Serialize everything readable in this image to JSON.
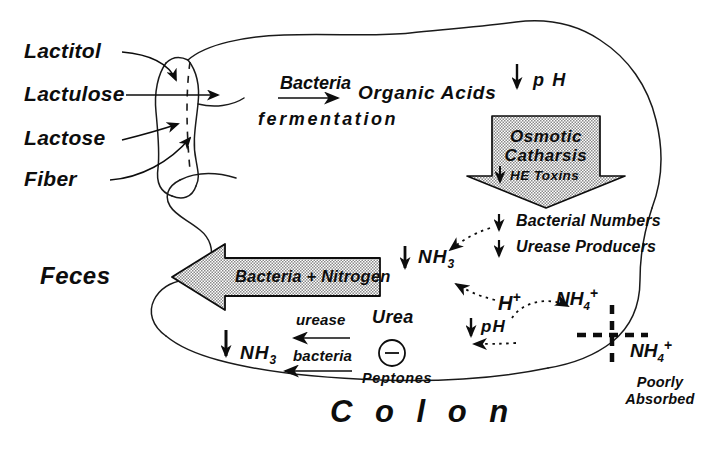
{
  "diagram": {
    "organ_label": "C o l o n"
  },
  "substrates": {
    "items": [
      {
        "label": "Lactitol"
      },
      {
        "label": "Lactulose"
      },
      {
        "label": "Lactose"
      },
      {
        "label": "Fiber"
      }
    ]
  },
  "fermentation": {
    "agent": "Bacteria",
    "process": "fermentation",
    "product": "Organic  Acids"
  },
  "ph_top": {
    "arrow": "↓",
    "label": "p H"
  },
  "osmotic": {
    "line1": "Osmotic",
    "line2": "Catharsis",
    "toxins_arrow": "↓",
    "toxins_label": "HE Toxins"
  },
  "bacterial": {
    "rows": [
      {
        "arrow": "↓",
        "label": "Bacterial Numbers"
      },
      {
        "arrow": "↓",
        "label": "Urease Producers"
      }
    ]
  },
  "feces": {
    "label": "Feces",
    "arrow_text": "Bacteria  +  Nitrogen"
  },
  "ammonia": {
    "upper": {
      "arrow": "↓",
      "label": "NH",
      "sub": "3"
    },
    "lower": {
      "arrow": "↓",
      "label": "NH",
      "sub": "3"
    }
  },
  "urea_cycle": {
    "enzyme": "urease",
    "organism": "bacteria",
    "substrate": "Urea",
    "peptones": "Peptones",
    "inhibition_symbol": "−"
  },
  "ions": {
    "proton": {
      "label": "H",
      "sup": "+"
    },
    "ammonium_inner": {
      "label": "NH",
      "sub": "4",
      "sup": "+"
    },
    "ammonium_outer": {
      "label": "NH",
      "sub": "4",
      "sup": "+"
    },
    "ph_low": {
      "arrow": "↓",
      "label": "pH"
    },
    "absorption_note_line1": "Poorly",
    "absorption_note_line2": "Absorbed"
  },
  "colors": {
    "ink": "#0d0d0d",
    "outline": "#1a1a1a",
    "stipple_fill": "#d9d9d9",
    "background": "#ffffff"
  }
}
